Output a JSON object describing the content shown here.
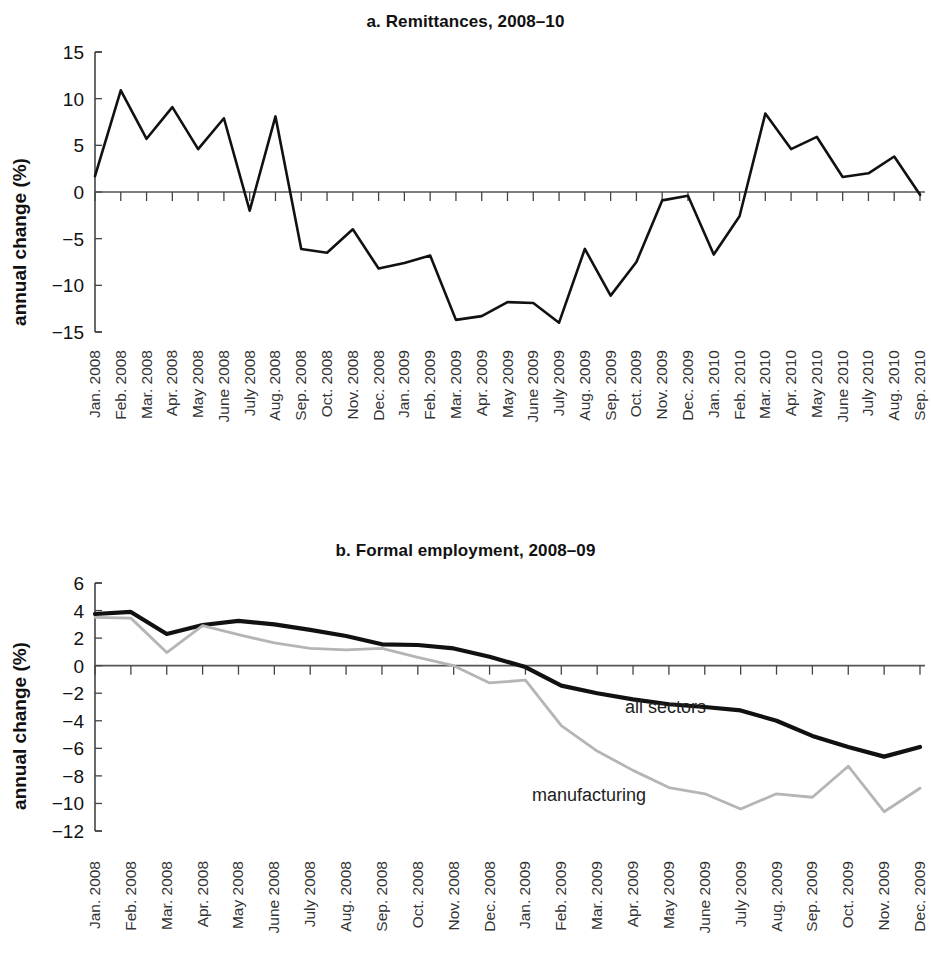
{
  "figure": {
    "panel_a_title": "a. Remittances, 2008–10",
    "panel_b_title": "b. Formal employment, 2008–09",
    "y_axis_title": "annual change (%)",
    "line_color_dark": "#111111",
    "line_color_gray": "#b5b5b5"
  },
  "chart_data": [
    {
      "type": "line",
      "title": "a. Remittances, 2008–10",
      "xlabel": "",
      "ylabel": "annual change (%)",
      "ylim": [
        -15,
        15
      ],
      "yticks": [
        15,
        10,
        5,
        0,
        -5,
        -10,
        -15
      ],
      "ytick_labels": [
        "15",
        "10",
        "5",
        "0",
        "−5",
        "−10",
        "−15"
      ],
      "grid": false,
      "legend": "none",
      "zero_line": true,
      "categories": [
        "Jan. 2008",
        "Feb. 2008",
        "Mar. 2008",
        "Apr. 2008",
        "May 2008",
        "June 2008",
        "July 2008",
        "Aug. 2008",
        "Sep. 2008",
        "Oct. 2008",
        "Nov. 2008",
        "Dec. 2008",
        "Jan. 2009",
        "Feb. 2009",
        "Mar. 2009",
        "Apr. 2009",
        "May 2009",
        "June 2009",
        "July 2009",
        "Aug. 2009",
        "Sep. 2009",
        "Oct. 2009",
        "Nov. 2009",
        "Dec. 2009",
        "Jan. 2010",
        "Feb. 2010",
        "Mar. 2010",
        "Apr. 2010",
        "May 2010",
        "June 2010",
        "July 2010",
        "Aug. 2010",
        "Sep. 2010"
      ],
      "series": [
        {
          "name": "remittances",
          "color": "#111111",
          "values": [
            1.7,
            10.9,
            5.7,
            9.1,
            4.6,
            7.9,
            -2.0,
            8.1,
            -6.1,
            -6.5,
            -4.0,
            -8.2,
            -7.6,
            -6.8,
            -13.7,
            -13.3,
            -11.8,
            -11.9,
            -14.0,
            -6.1,
            -11.1,
            -7.5,
            -0.9,
            -0.4,
            -6.7,
            -2.6,
            8.4,
            4.6,
            5.9,
            1.6,
            2.0,
            3.8,
            -0.3
          ]
        }
      ]
    },
    {
      "type": "line",
      "title": "b. Formal employment, 2008–09",
      "xlabel": "",
      "ylabel": "annual change (%)",
      "ylim": [
        -12,
        6
      ],
      "yticks": [
        6,
        4,
        2,
        0,
        -2,
        -4,
        -6,
        -8,
        -10,
        -12
      ],
      "ytick_labels": [
        "6",
        "4",
        "2",
        "0",
        "−2",
        "−4",
        "−6",
        "−8",
        "−10",
        "−12"
      ],
      "grid": false,
      "legend": "inline",
      "zero_line": true,
      "categories": [
        "Jan. 2008",
        "Feb. 2008",
        "Mar. 2008",
        "Apr. 2008",
        "May 2008",
        "June 2008",
        "July 2008",
        "Aug. 2008",
        "Sep. 2008",
        "Oct. 2008",
        "Nov. 2008",
        "Dec. 2008",
        "Jan. 2009",
        "Feb. 2009",
        "Mar. 2009",
        "Apr. 2009",
        "May 2009",
        "June 2009",
        "July 2009",
        "Aug. 2009",
        "Sep. 2009",
        "Oct. 2009",
        "Nov. 2009",
        "Dec. 2009"
      ],
      "series": [
        {
          "name": "all sectors",
          "label": "all sectors",
          "color": "#111111",
          "values": [
            3.75,
            3.9,
            2.3,
            2.95,
            3.25,
            3.0,
            2.6,
            2.15,
            1.55,
            1.5,
            1.25,
            0.65,
            -0.1,
            -1.45,
            -2.0,
            -2.45,
            -2.8,
            -3.0,
            -3.25,
            -4.0,
            -5.1,
            -5.9,
            -6.6,
            -5.9
          ]
        },
        {
          "name": "manufacturing",
          "label": "manufacturing",
          "color": "#b5b5b5",
          "values": [
            3.5,
            3.45,
            0.95,
            2.9,
            2.25,
            1.65,
            1.25,
            1.15,
            1.25,
            0.6,
            0.0,
            -1.25,
            -1.05,
            -4.35,
            -6.2,
            -7.6,
            -8.85,
            -9.3,
            -10.4,
            -9.3,
            -9.55,
            -7.3,
            -10.6,
            -8.9
          ]
        }
      ],
      "annotations": [
        {
          "text": "all sectors",
          "color": "#222222"
        },
        {
          "text": "manufacturing",
          "color": "#222222"
        }
      ]
    }
  ]
}
